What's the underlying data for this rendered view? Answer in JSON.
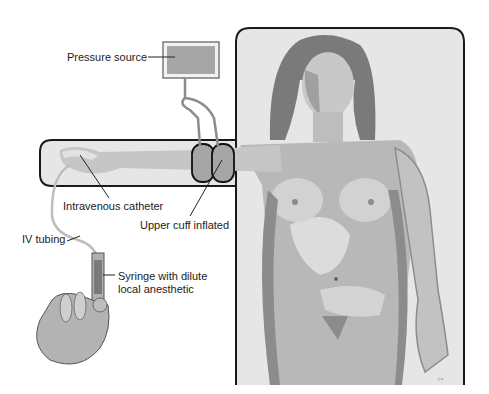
{
  "diagram": {
    "labels": {
      "pressure_source": "Pressure source",
      "intravenous_catheter": "Intravenous catheter",
      "upper_cuff_inflated": "Upper cuff inflated",
      "iv_tubing": "IV tubing",
      "syringe_line1": "Syringe with dilute",
      "syringe_line2": "local anesthetic"
    },
    "colors": {
      "panel_fill": "#e6e6e6",
      "panel_border": "#1a1a1a",
      "skin_light": "#d9d9d9",
      "skin_mid": "#b3b3b3",
      "skin_dark": "#8c8c8c",
      "hair": "#7a7a7a",
      "cuff": "#a6a6a6"
    }
  }
}
